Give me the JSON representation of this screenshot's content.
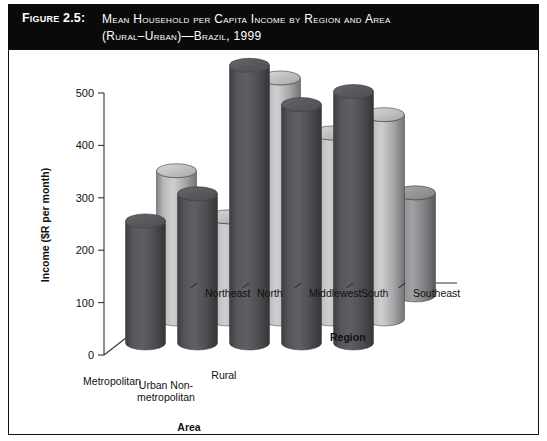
{
  "figure": {
    "label": "Figure 2.5:",
    "title_line1": "Mean Household per Capita Income by Region and Area",
    "title_line2": "(Rural–Urban)—Brazil, 1999"
  },
  "chart_data": {
    "type": "bar",
    "render": "3d-grouped-cylinder",
    "title": "Mean Household per Capita Income by Region and Area (Rural–Urban)—Brazil, 1999",
    "xlabel": "Region",
    "zlabel": "Area",
    "ylabel": "Income ($R per month)",
    "ylim": [
      0,
      500
    ],
    "yticks": [
      0,
      100,
      200,
      300,
      400,
      500
    ],
    "ytick_labels": [
      "0",
      "100",
      "200",
      "300",
      "400",
      "500"
    ],
    "grid": false,
    "legend": "none",
    "categories": [
      "Northeast",
      "North",
      "Middlewest",
      "South",
      "Southeast"
    ],
    "depth_categories": [
      "Metropolitan",
      "Urban Non-metropolitan",
      "Rural"
    ],
    "series": [
      {
        "name": "Metropolitan",
        "color": "#55565a",
        "values": [
          233,
          285,
          530,
          455,
          480
        ]
      },
      {
        "name": "Urban Non-metropolitan",
        "color": "#b9b9bb",
        "values": [
          283,
          195,
          460,
          355,
          390
        ]
      },
      {
        "name": "Rural",
        "color": "#8f9093",
        "values": [
          145,
          55,
          285,
          160,
          195
        ]
      }
    ]
  },
  "labels": {
    "y_axis": "Income ($R per month)",
    "area_axis": "Area",
    "region_axis": "Region",
    "area_cats": [
      "Metropolitan",
      "Urban Non-",
      "metropolitan",
      "Rural"
    ],
    "region_cats": [
      "Northeast",
      "North",
      "Middlewest",
      "South",
      "Southeast"
    ]
  },
  "colors": {
    "banner_bg": "#0a0a0a",
    "banner_text": "#ffffff",
    "frame": "#111111",
    "bar_dark": "#55565a",
    "bar_mid": "#8f9093",
    "bar_light": "#b9b9bb",
    "background": "#ffffff"
  }
}
